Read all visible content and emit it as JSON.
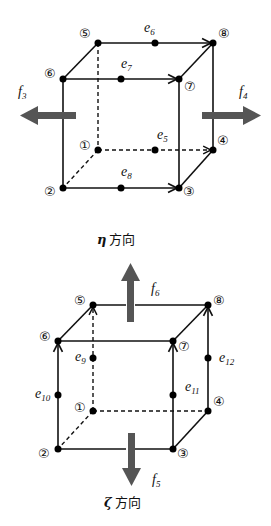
{
  "top_cube": {
    "nodes": [
      {
        "id": 1,
        "label": "①",
        "x": 98,
        "y": 150
      },
      {
        "id": 2,
        "label": "②",
        "x": 63,
        "y": 188
      },
      {
        "id": 3,
        "label": "③",
        "x": 179,
        "y": 188
      },
      {
        "id": 4,
        "label": "④",
        "x": 213,
        "y": 150
      },
      {
        "id": 5,
        "label": "⑤",
        "x": 98,
        "y": 43
      },
      {
        "id": 6,
        "label": "⑥",
        "x": 63,
        "y": 79
      },
      {
        "id": 7,
        "label": "⑦",
        "x": 179,
        "y": 79
      },
      {
        "id": 8,
        "label": "⑧",
        "x": 213,
        "y": 43
      }
    ],
    "edges": [
      {
        "name": "e5",
        "base": "e",
        "sub": "5",
        "from": 1,
        "to": 4,
        "dashed": true
      },
      {
        "name": "e6",
        "base": "e",
        "sub": "6",
        "from": 5,
        "to": 8,
        "dashed": false
      },
      {
        "name": "e7",
        "base": "e",
        "sub": "7",
        "from": 6,
        "to": 7,
        "dashed": false
      },
      {
        "name": "e8",
        "base": "e",
        "sub": "8",
        "from": 2,
        "to": 3,
        "dashed": false
      }
    ],
    "forces": [
      {
        "name": "f3",
        "base": "f",
        "sub": "3",
        "direction": "left"
      },
      {
        "name": "f4",
        "base": "f",
        "sub": "4",
        "direction": "right"
      }
    ]
  },
  "bottom_cube": {
    "nodes": [
      {
        "id": 1,
        "label": "①",
        "x": 93,
        "y": 411
      },
      {
        "id": 2,
        "label": "②",
        "x": 58,
        "y": 449
      },
      {
        "id": 3,
        "label": "③",
        "x": 173,
        "y": 449
      },
      {
        "id": 4,
        "label": "④",
        "x": 208,
        "y": 411
      },
      {
        "id": 5,
        "label": "⑤",
        "x": 93,
        "y": 305
      },
      {
        "id": 6,
        "label": "⑥",
        "x": 58,
        "y": 341
      },
      {
        "id": 7,
        "label": "⑦",
        "x": 173,
        "y": 341
      },
      {
        "id": 8,
        "label": "⑧",
        "x": 208,
        "y": 305
      }
    ],
    "edges": [
      {
        "name": "e9",
        "base": "e",
        "sub": "9",
        "from": 1,
        "to": 5,
        "dashed": true
      },
      {
        "name": "e10",
        "base": "e",
        "sub": "10",
        "from": 2,
        "to": 6,
        "dashed": false
      },
      {
        "name": "e11",
        "base": "e",
        "sub": "11",
        "from": 3,
        "to": 7,
        "dashed": false
      },
      {
        "name": "e12",
        "base": "e",
        "sub": "12",
        "from": 4,
        "to": 8,
        "dashed": false
      }
    ],
    "forces": [
      {
        "name": "f6",
        "base": "f",
        "sub": "6",
        "direction": "up"
      },
      {
        "name": "f5",
        "base": "f",
        "sub": "5",
        "direction": "down"
      }
    ],
    "direction_labels": {
      "eta": {
        "symbol": "η",
        "text": "方向"
      },
      "zeta": {
        "symbol": "ζ",
        "text": "方向"
      }
    }
  },
  "colors": {
    "line": "#111111",
    "force_arrow": "#555555",
    "background": "#ffffff"
  }
}
